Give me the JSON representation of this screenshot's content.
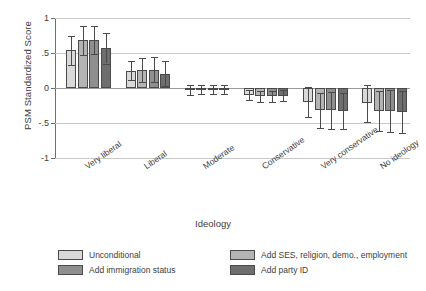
{
  "chart_data": {
    "type": "bar",
    "title": "",
    "xlabel": "Ideology",
    "ylabel": "PSM Standardized Score",
    "ylim": [
      -1,
      1
    ],
    "ytick_labels": [
      "1",
      ".5",
      "0",
      "-.5",
      "-1"
    ],
    "ytick_values": [
      1,
      0.5,
      0,
      -0.5,
      -1
    ],
    "grid": "horizontal gridlines at 1, .5, 0, -.5, -1",
    "legend_position": "below plot, two columns",
    "error_bars": "95% confidence intervals",
    "categories": [
      "Very liberal",
      "Liberal",
      "Moderate",
      "Conservative",
      "Very conservative",
      "No ideology"
    ],
    "series": [
      {
        "name": "Unconditional",
        "color": "#d9d9d9",
        "values": [
          0.54,
          0.25,
          -0.03,
          -0.1,
          -0.2,
          -0.22
        ],
        "ci_low": [
          0.33,
          0.12,
          -0.1,
          -0.17,
          -0.42,
          -0.48
        ],
        "ci_high": [
          0.74,
          0.39,
          0.04,
          -0.03,
          0.01,
          0.04
        ]
      },
      {
        "name": "Add SES, religion, demo., employment",
        "color": "#b4b4b4",
        "values": [
          0.68,
          0.26,
          -0.02,
          -0.12,
          -0.32,
          -0.33
        ],
        "ci_low": [
          0.47,
          0.09,
          -0.09,
          -0.2,
          -0.57,
          -0.62
        ],
        "ci_high": [
          0.88,
          0.43,
          0.05,
          -0.04,
          -0.07,
          -0.04
        ]
      },
      {
        "name": "Add immigration status",
        "color": "#8f8f8f",
        "values": [
          0.68,
          0.26,
          -0.02,
          -0.12,
          -0.32,
          -0.33
        ],
        "ci_low": [
          0.48,
          0.08,
          -0.09,
          -0.2,
          -0.58,
          -0.63
        ],
        "ci_high": [
          0.89,
          0.44,
          0.05,
          -0.04,
          -0.06,
          -0.03
        ]
      },
      {
        "name": "Add party ID",
        "color": "#6e6e6e",
        "values": [
          0.57,
          0.2,
          -0.02,
          -0.11,
          -0.33,
          -0.34
        ],
        "ci_low": [
          0.35,
          0.03,
          -0.09,
          -0.19,
          -0.59,
          -0.64
        ],
        "ci_high": [
          0.79,
          0.38,
          0.05,
          -0.03,
          -0.07,
          -0.04
        ]
      }
    ]
  },
  "legend": {
    "items": [
      {
        "label": "Unconditional",
        "color": "#d9d9d9"
      },
      {
        "label": "Add SES, religion, demo., employment",
        "color": "#b4b4b4"
      },
      {
        "label": "Add immigration status",
        "color": "#8f8f8f"
      },
      {
        "label": "Add party ID",
        "color": "#6e6e6e"
      }
    ]
  }
}
